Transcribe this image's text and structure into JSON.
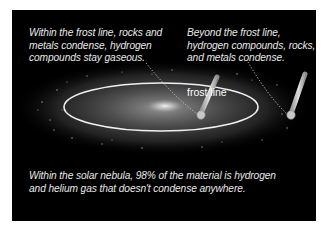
{
  "diagram": {
    "captions": {
      "inner": "Within the frost line, rocks and metals condense, hydrogen compounds stay gaseous.",
      "outer": "Beyond the frost line, hydrogen compounds, rocks, and metals condense.",
      "bottom": "Within the solar nebula, 98% of the material is hydrogen and helium gas that doesn't condense anywhere."
    },
    "labels": {
      "frost_line": "frost line"
    },
    "icons": {
      "thermometer_inner": "thermometer-icon",
      "thermometer_outer": "thermometer-icon"
    },
    "colors": {
      "background": "#000000",
      "page": "#ffffff",
      "text": "#e8e8e8",
      "frost_line": "#f0f0f0",
      "nebula": "#6a6a6a"
    }
  }
}
